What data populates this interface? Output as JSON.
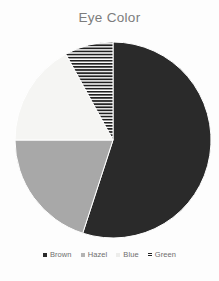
{
  "chart_data": {
    "type": "pie",
    "title": "Eye Color",
    "xlabel": "",
    "ylabel": "",
    "categories": [
      "Brown",
      "Hazel",
      "Blue",
      "Green"
    ],
    "values": [
      55,
      20,
      17,
      8
    ],
    "units": "percent",
    "legend_position": "bottom",
    "grid": false,
    "start_angle_deg": 0,
    "direction": "clockwise",
    "slices": [
      {
        "label": "Brown",
        "value": 55,
        "color": "#2a2a2a",
        "pattern": "solid",
        "start_angle_deg": 0,
        "end_angle_deg": 198
      },
      {
        "label": "Hazel",
        "value": 20,
        "color": "#a8a8a8",
        "pattern": "solid",
        "start_angle_deg": 198,
        "end_angle_deg": 270
      },
      {
        "label": "Blue",
        "value": 17,
        "color": "#f5f5f3",
        "pattern": "solid",
        "start_angle_deg": 270,
        "end_angle_deg": 331.2
      },
      {
        "label": "Green",
        "value": 8,
        "color": "#ffffff",
        "pattern": "horizontal-hatch",
        "start_angle_deg": 331.2,
        "end_angle_deg": 360
      }
    ]
  },
  "title": {
    "text": "Eye Color"
  },
  "legend": {
    "items": [
      {
        "label": "Brown",
        "marker": "square-solid",
        "color": "#2a2a2a"
      },
      {
        "label": "Hazel",
        "marker": "square-solid",
        "color": "#a8a8a8"
      },
      {
        "label": "Blue",
        "marker": "square-solid",
        "color": "#f1f1ef"
      },
      {
        "label": "Green",
        "marker": "square-hatch",
        "color": "#333333"
      }
    ]
  },
  "colors": {
    "background": "#fdfdfd",
    "title_text": "#7c7c7c",
    "legend_text": "#6e6e6e",
    "brown": "#2a2a2a",
    "hazel": "#a8a8a8",
    "blue": "#f5f5f3",
    "green_hatch_dark": "#1f1f1f",
    "green_hatch_light": "#ffffff",
    "slice_outline": "#ffffff"
  }
}
